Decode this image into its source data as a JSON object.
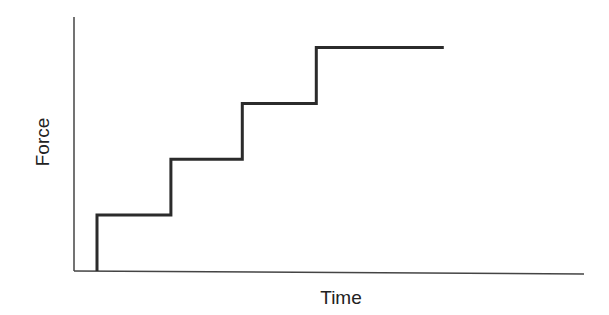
{
  "chart_data": {
    "type": "line",
    "subtype": "step",
    "title": "",
    "xlabel": "Time",
    "ylabel": "Force",
    "x_ticks": [],
    "y_ticks": [],
    "grid": false,
    "legend": null,
    "xlim": [
      0,
      10
    ],
    "ylim": [
      0,
      10
    ],
    "series": [
      {
        "name": "Force",
        "color": "#2b2b2b",
        "points": [
          {
            "x": 0.45,
            "y": 0
          },
          {
            "x": 0.45,
            "y": 2.2
          },
          {
            "x": 1.9,
            "y": 2.2
          },
          {
            "x": 1.9,
            "y": 4.4
          },
          {
            "x": 3.3,
            "y": 4.4
          },
          {
            "x": 3.3,
            "y": 6.6
          },
          {
            "x": 4.75,
            "y": 6.6
          },
          {
            "x": 4.75,
            "y": 8.8
          },
          {
            "x": 7.25,
            "y": 8.8
          }
        ]
      }
    ],
    "annotations": []
  },
  "layout": {
    "plot_left": 74,
    "plot_right": 584,
    "plot_top": 17,
    "plot_bottom": 271,
    "axis_color": "#444444"
  }
}
